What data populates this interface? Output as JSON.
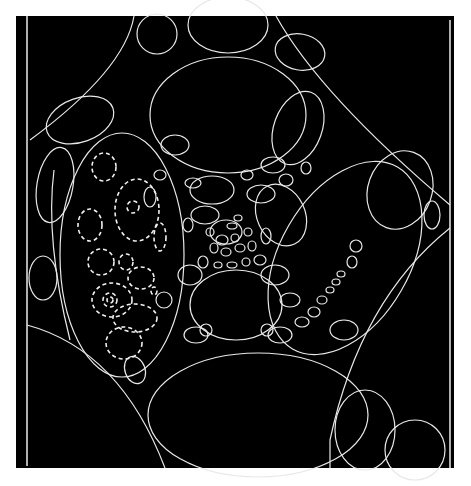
{
  "figure": {
    "background_color": "#000000",
    "stroke_color": "#e8e8e8",
    "dashed_stroke_color": "#f0f0f0",
    "page_color": "#ffffff"
  },
  "caption": {
    "text": ""
  }
}
